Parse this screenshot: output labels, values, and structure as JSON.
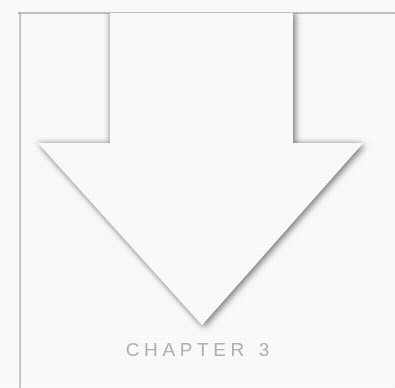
{
  "page": {
    "background_color": "#ffffff",
    "width": 395,
    "height": 388,
    "chapter_label": "CHAPTER 3",
    "chapter_label_color": "#a9a9ac"
  },
  "border": {
    "top_rule_color": "#969696",
    "left_rule_color": "#9b9b9b"
  },
  "arrow": {
    "name": "down-arrow",
    "fill_color": "#ffffff",
    "shadow_color": "#8c8c8c",
    "direction": "down",
    "shaft_left_x": 110,
    "shaft_right_x": 293,
    "shaft_top_y": 13,
    "shoulder_y": 143,
    "head_left_x": 38,
    "head_right_x": 363,
    "tip_x": 202,
    "tip_y": 325
  }
}
